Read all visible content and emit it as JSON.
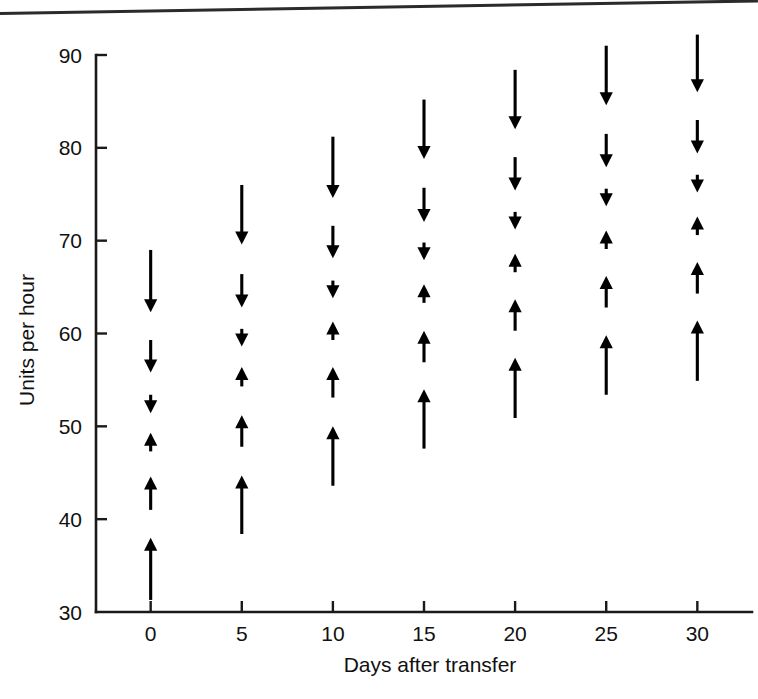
{
  "page": {
    "background_color": "#ffffff",
    "ink_color": "#000000",
    "top_rule": true
  },
  "chart_data": {
    "type": "scatter",
    "title": "",
    "subtitle": "",
    "xlabel": "Days after transfer",
    "ylabel": "Units per hour",
    "xlim": [
      -3,
      33
    ],
    "ylim": [
      30,
      90
    ],
    "xticks": [
      0,
      5,
      10,
      15,
      20,
      25,
      30
    ],
    "xtick_labels": [
      "0",
      "5",
      "10",
      "15",
      "20",
      "25",
      "30"
    ],
    "yticks": [
      30,
      40,
      50,
      60,
      70,
      80,
      90
    ],
    "ytick_labels": [
      "30",
      "40",
      "50",
      "60",
      "70",
      "80",
      "90"
    ],
    "grid": false,
    "legend": null,
    "marker_style": "vertical-arrow-range",
    "groups": [
      {
        "x": 0,
        "x_label": "0",
        "arrows": [
          {
            "direction": "down",
            "from": 69.0,
            "to": 62.3
          },
          {
            "direction": "down",
            "from": 59.3,
            "to": 55.8
          },
          {
            "direction": "down",
            "from": 53.4,
            "to": 51.4
          },
          {
            "direction": "up",
            "from": 47.3,
            "to": 49.3
          },
          {
            "direction": "up",
            "from": 41.0,
            "to": 44.6
          },
          {
            "direction": "up",
            "from": 31.3,
            "to": 38.0
          }
        ]
      },
      {
        "x": 5,
        "x_label": "5",
        "arrows": [
          {
            "direction": "down",
            "from": 76.0,
            "to": 69.6
          },
          {
            "direction": "down",
            "from": 66.4,
            "to": 62.8
          },
          {
            "direction": "down",
            "from": 60.5,
            "to": 58.6
          },
          {
            "direction": "up",
            "from": 54.3,
            "to": 56.4
          },
          {
            "direction": "up",
            "from": 47.8,
            "to": 51.2
          },
          {
            "direction": "up",
            "from": 38.4,
            "to": 44.7
          }
        ]
      },
      {
        "x": 10,
        "x_label": "10",
        "arrows": [
          {
            "direction": "down",
            "from": 81.2,
            "to": 74.6
          },
          {
            "direction": "down",
            "from": 71.6,
            "to": 68.1
          },
          {
            "direction": "down",
            "from": 65.7,
            "to": 63.8
          },
          {
            "direction": "up",
            "from": 59.3,
            "to": 61.3
          },
          {
            "direction": "up",
            "from": 53.1,
            "to": 56.4
          },
          {
            "direction": "up",
            "from": 43.6,
            "to": 50.0
          }
        ]
      },
      {
        "x": 15,
        "x_label": "15",
        "arrows": [
          {
            "direction": "down",
            "from": 85.2,
            "to": 78.8
          },
          {
            "direction": "down",
            "from": 75.7,
            "to": 72.0
          },
          {
            "direction": "down",
            "from": 69.8,
            "to": 67.9
          },
          {
            "direction": "up",
            "from": 63.3,
            "to": 65.3
          },
          {
            "direction": "up",
            "from": 56.9,
            "to": 60.3
          },
          {
            "direction": "up",
            "from": 47.6,
            "to": 54.0
          }
        ]
      },
      {
        "x": 20,
        "x_label": "20",
        "arrows": [
          {
            "direction": "down",
            "from": 88.4,
            "to": 82.0
          },
          {
            "direction": "down",
            "from": 79.0,
            "to": 75.4
          },
          {
            "direction": "down",
            "from": 73.1,
            "to": 71.2
          },
          {
            "direction": "up",
            "from": 66.6,
            "to": 68.6
          },
          {
            "direction": "up",
            "from": 60.3,
            "to": 63.7
          },
          {
            "direction": "up",
            "from": 50.9,
            "to": 57.4
          }
        ]
      },
      {
        "x": 25,
        "x_label": "25",
        "arrows": [
          {
            "direction": "down",
            "from": 91.0,
            "to": 84.6
          },
          {
            "direction": "down",
            "from": 81.5,
            "to": 77.9
          },
          {
            "direction": "down",
            "from": 75.6,
            "to": 73.7
          },
          {
            "direction": "up",
            "from": 69.1,
            "to": 71.1
          },
          {
            "direction": "up",
            "from": 62.8,
            "to": 66.2
          },
          {
            "direction": "up",
            "from": 53.4,
            "to": 59.8
          }
        ]
      },
      {
        "x": 30,
        "x_label": "30",
        "arrows": [
          {
            "direction": "down",
            "from": 92.2,
            "to": 86.0
          },
          {
            "direction": "down",
            "from": 83.0,
            "to": 79.4
          },
          {
            "direction": "down",
            "from": 77.1,
            "to": 75.2
          },
          {
            "direction": "up",
            "from": 70.6,
            "to": 72.6
          },
          {
            "direction": "up",
            "from": 64.3,
            "to": 67.7
          },
          {
            "direction": "up",
            "from": 54.9,
            "to": 61.4
          }
        ]
      }
    ]
  }
}
